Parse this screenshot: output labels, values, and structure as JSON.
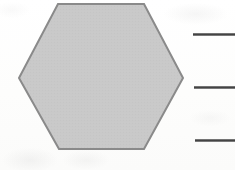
{
  "page": {
    "background_color": "#fdfdfc"
  },
  "shape": {
    "name": "hexagon",
    "sides": 6,
    "fill_color": "#c8c8c8",
    "stroke_color": "#8a8a8a",
    "stroke_width": 2,
    "vertices": [
      [
        58,
        4
      ],
      [
        144,
        4
      ],
      [
        183,
        78
      ],
      [
        144,
        149
      ],
      [
        59,
        149
      ],
      [
        19,
        78
      ]
    ]
  },
  "answer_lines": {
    "count": 3,
    "color": "#3d3d3d",
    "items": [
      {
        "id": "answer-line-1",
        "x": 193,
        "y": 33,
        "width": 42,
        "thickness": 3
      },
      {
        "id": "answer-line-2",
        "x": 194,
        "y": 86,
        "width": 41,
        "thickness": 3
      },
      {
        "id": "answer-line-3",
        "x": 195,
        "y": 139,
        "width": 40,
        "thickness": 3
      }
    ]
  }
}
